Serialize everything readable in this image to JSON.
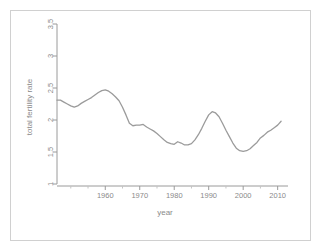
{
  "figure": {
    "background_color": "#ffffff",
    "frame_color": "#d0d0d0",
    "axis_color": "#9a9a9a",
    "line_color": "#9b9b9b",
    "text_color": "#8a8a8a"
  },
  "chart_data": {
    "type": "line",
    "title": "",
    "xlabel": "year",
    "ylabel": "total fertility rate",
    "xlim": [
      1946,
      2013
    ],
    "ylim": [
      1,
      3.5
    ],
    "grid": false,
    "legend": "none",
    "xticks": [
      1960,
      1970,
      1980,
      1990,
      2000,
      2010
    ],
    "xtick_labels": [
      "1960",
      "1970",
      "1980",
      "1990",
      "2000",
      "2010"
    ],
    "yticks": [
      1,
      1.5,
      2,
      2.5,
      3,
      3.5
    ],
    "ytick_labels": [
      "1",
      "1.5",
      "2",
      "2.5",
      "3",
      "3.5"
    ],
    "series": [
      {
        "name": "total fertility rate",
        "color": "#9b9b9b",
        "x": [
          1946,
          1947,
          1948,
          1949,
          1950,
          1951,
          1952,
          1953,
          1954,
          1955,
          1956,
          1957,
          1958,
          1959,
          1960,
          1961,
          1962,
          1963,
          1964,
          1965,
          1966,
          1967,
          1968,
          1969,
          1970,
          1971,
          1972,
          1973,
          1974,
          1975,
          1976,
          1977,
          1978,
          1979,
          1980,
          1981,
          1982,
          1983,
          1984,
          1985,
          1986,
          1987,
          1988,
          1989,
          1990,
          1991,
          1992,
          1993,
          1994,
          1995,
          1996,
          1997,
          1998,
          1999,
          2000,
          2001,
          2002,
          2003,
          2004,
          2005,
          2006,
          2007,
          2008,
          2009,
          2010,
          2011
        ],
        "y": [
          2.31,
          2.31,
          2.28,
          2.25,
          2.22,
          2.2,
          2.22,
          2.26,
          2.29,
          2.32,
          2.35,
          2.39,
          2.43,
          2.46,
          2.47,
          2.45,
          2.41,
          2.36,
          2.3,
          2.2,
          2.08,
          1.95,
          1.91,
          1.92,
          1.92,
          1.93,
          1.89,
          1.86,
          1.83,
          1.79,
          1.74,
          1.69,
          1.65,
          1.63,
          1.62,
          1.66,
          1.64,
          1.61,
          1.61,
          1.63,
          1.69,
          1.77,
          1.87,
          1.98,
          2.08,
          2.13,
          2.11,
          2.05,
          1.95,
          1.84,
          1.74,
          1.64,
          1.56,
          1.52,
          1.51,
          1.52,
          1.55,
          1.6,
          1.65,
          1.72,
          1.76,
          1.81,
          1.84,
          1.88,
          1.92,
          1.98
        ]
      }
    ]
  }
}
